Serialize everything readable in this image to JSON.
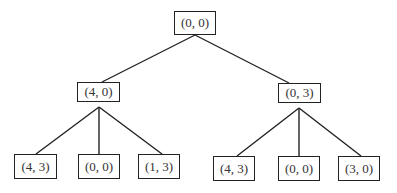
{
  "tree": {
    "nodes": [
      {
        "id": "root",
        "label": "(0, 0)",
        "x": 174,
        "y": 11,
        "w": 42,
        "h": 24
      },
      {
        "id": "l",
        "label": "(4, 0)",
        "x": 77,
        "y": 82,
        "w": 43,
        "h": 20
      },
      {
        "id": "r",
        "label": "(0, 3)",
        "x": 278,
        "y": 83,
        "w": 43,
        "h": 20
      },
      {
        "id": "ll",
        "label": "(4, 3)",
        "x": 14,
        "y": 154,
        "w": 43,
        "h": 25
      },
      {
        "id": "lm",
        "label": "(0, 0)",
        "x": 78,
        "y": 154,
        "w": 42,
        "h": 25
      },
      {
        "id": "lr",
        "label": "(1, 3)",
        "x": 138,
        "y": 154,
        "w": 42,
        "h": 25
      },
      {
        "id": "rl",
        "label": "(4, 3)",
        "x": 213,
        "y": 156,
        "w": 42,
        "h": 25
      },
      {
        "id": "rm",
        "label": "(0, 0)",
        "x": 278,
        "y": 156,
        "w": 42,
        "h": 25
      },
      {
        "id": "rr",
        "label": "(3, 0)",
        "x": 338,
        "y": 156,
        "w": 42,
        "h": 25
      }
    ],
    "edges": [
      {
        "from": "root",
        "to": "l"
      },
      {
        "from": "root",
        "to": "r"
      },
      {
        "from": "l",
        "to": "ll"
      },
      {
        "from": "l",
        "to": "lm"
      },
      {
        "from": "l",
        "to": "lr"
      },
      {
        "from": "r",
        "to": "rl"
      },
      {
        "from": "r",
        "to": "rm"
      },
      {
        "from": "r",
        "to": "rr"
      }
    ]
  }
}
